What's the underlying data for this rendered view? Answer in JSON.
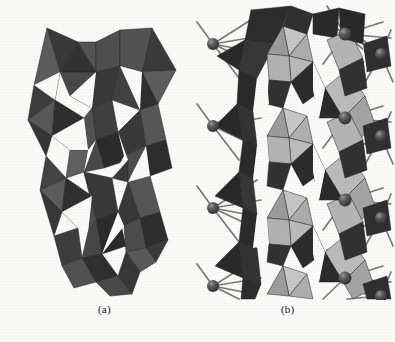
{
  "figure": {
    "kind": "crystal-structure-figure",
    "background_color": "#fcfcfb",
    "width": 395,
    "height": 342
  },
  "panels": [
    {
      "id": "a",
      "caption": "(a)",
      "description": "Polyhedral representation of a layered crystal framework built from corner- and edge-sharing octahedra and tetrahedra, shaded in dark grey tones.",
      "render_style": "polyhedra-only",
      "palette": {
        "face_darkest": "#2e2e2e",
        "face_dark": "#3f3f3f",
        "face_mid": "#555555",
        "face_light": "#6e6e6e",
        "face_lighter": "#8a8a8a",
        "edge": "#1c1c1c"
      }
    },
    {
      "id": "b",
      "caption": "(b)",
      "description": "Same framework shown with an additional column of light-grey octahedra and with interlayer cation spheres connected by bond rods.",
      "render_style": "polyhedra-with-atoms-and-bonds",
      "palette": {
        "face_darkest": "#2b2b2b",
        "face_dark": "#3c3c3c",
        "face_mid": "#565656",
        "light_face_bright": "#cfcfcf",
        "light_face_mid": "#b0b0b0",
        "light_face_shade": "#8f8f8f",
        "atom_sphere": "#4a4a4a",
        "atom_highlight": "#8c8c8c",
        "bond_rod": "#707070",
        "edge": "#1c1c1c"
      },
      "atoms": {
        "label": "cation-sphere",
        "count": 12,
        "radius_px": 6
      },
      "bonds": {
        "label": "bond-rod",
        "count": 60
      }
    }
  ]
}
